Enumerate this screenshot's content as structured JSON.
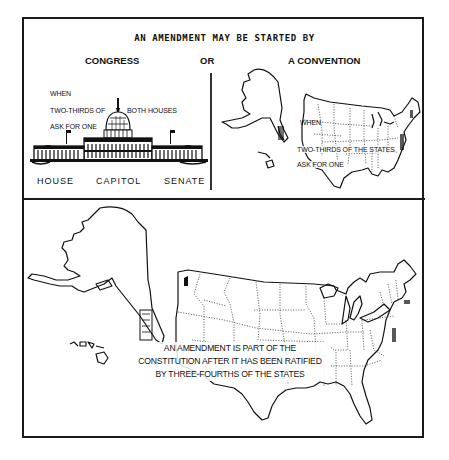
{
  "figure": {
    "title": "AN AMENDMENT MAY BE STARTED BY",
    "separator_word": "OR"
  },
  "congress_panel": {
    "heading": "CONGRESS",
    "when": "WHEN",
    "line1_left": "TWO-THIRDS OF",
    "line1_right": "BOTH HOUSES",
    "line2": "ASK FOR ONE",
    "illustration": "us-capitol-building",
    "labels": [
      "HOUSE",
      "CAPITOL",
      "SENATE"
    ]
  },
  "convention_panel": {
    "heading": "A CONVENTION",
    "when": "WHEN",
    "line1": "TWO-THIRDS OF THE STATES",
    "line2": "ASK FOR ONE",
    "illustration": "us-map-small"
  },
  "ratification_panel": {
    "illustration": "us-map-large",
    "text_lines": [
      "AN AMENDMENT IS PART OF THE",
      "CONSTITUTION AFTER IT HAS BEEN RATIFIED",
      "BY THREE-FOURTHS OF THE STATES"
    ]
  }
}
